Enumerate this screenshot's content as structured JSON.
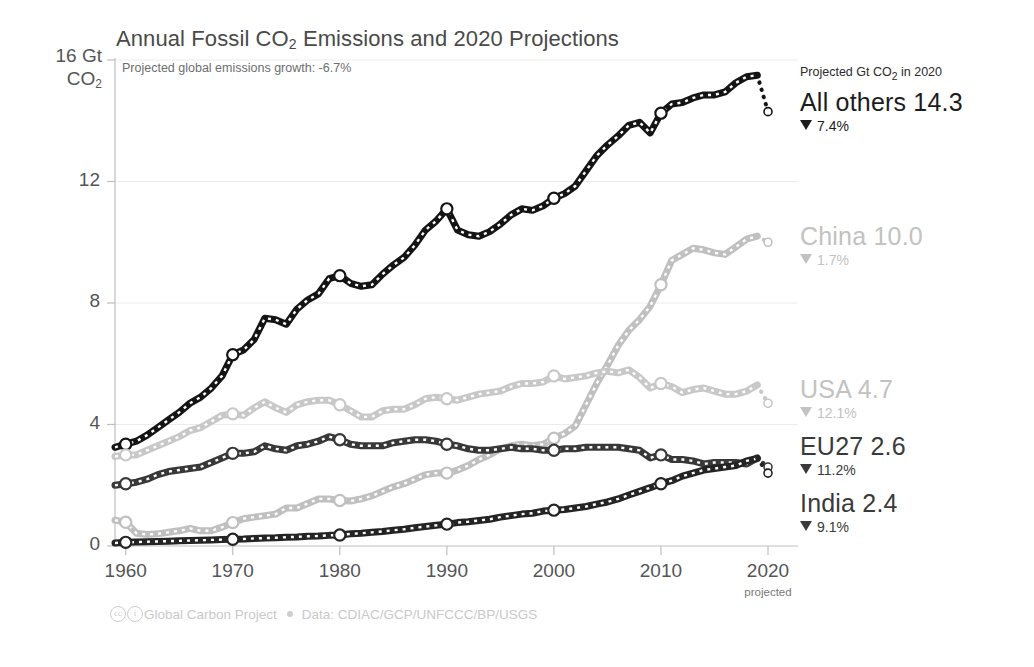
{
  "header": {
    "title_pre": "Annual Fossil CO",
    "title_sub": "2",
    "title_post": " Emissions and 2020 Projections",
    "subtitle": "Projected global emissions growth: -6.7%"
  },
  "axes": {
    "y_top_label_line1": "16 Gt",
    "y_top_label_line2_pre": "CO",
    "y_top_label_line2_sub": "2",
    "y_ticks": [
      "12",
      "8",
      "4",
      "0"
    ],
    "y_tick_values": [
      12,
      8,
      4,
      0
    ],
    "x_ticks": [
      "1960",
      "1970",
      "1980",
      "1990",
      "2000",
      "2010",
      "2020"
    ],
    "x_tick_values": [
      1960,
      1970,
      1980,
      1990,
      2000,
      2010,
      2020
    ],
    "x_sub_note": "projected"
  },
  "legend": {
    "heading_pre": "Projected Gt CO",
    "heading_sub": "2",
    "heading_post": " in 2020",
    "entries": [
      {
        "name": "All others",
        "value": "14.3",
        "label": "All others 14.3",
        "change": "7.4%",
        "color": "#1c1c1c",
        "tone": "dark"
      },
      {
        "name": "China",
        "value": "10.0",
        "label": "China 10.0",
        "change": "1.7%",
        "color": "#c2c2c2",
        "tone": "light"
      },
      {
        "name": "USA",
        "value": "4.7",
        "label": "USA 4.7",
        "change": "12.1%",
        "color": "#bdbdbd",
        "tone": "light"
      },
      {
        "name": "EU27",
        "value": "2.6",
        "label": "EU27 2.6",
        "change": "11.2%",
        "color": "#3a3a3a",
        "tone": "mid"
      },
      {
        "name": "India",
        "value": "2.4",
        "label": "India 2.4",
        "change": "9.1%",
        "color": "#2b2b2b",
        "tone": "mid"
      }
    ]
  },
  "footer": {
    "cc_icon_1": "cc",
    "cc_icon_2": "i",
    "org": "Global Carbon Project",
    "data_credit": "Data: CDIAC/GCP/UNFCCC/BP/USGS"
  },
  "chart_data": {
    "type": "line",
    "title": "Annual Fossil CO2 Emissions and 2020 Projections",
    "subtitle": "Projected global emissions growth: -6.7%",
    "xlabel": "",
    "ylabel": "Gt CO2",
    "xlim": [
      1959,
      2020
    ],
    "ylim": [
      0,
      16
    ],
    "grid": true,
    "legend_position": "right",
    "marker_years": [
      1960,
      1970,
      1980,
      1990,
      2000,
      2010
    ],
    "series": [
      {
        "name": "All others",
        "color": "#141414",
        "projected_2020": 14.3,
        "change_pct": -7.4,
        "x": [
          1959,
          1960,
          1961,
          1962,
          1963,
          1964,
          1965,
          1966,
          1967,
          1968,
          1969,
          1970,
          1971,
          1972,
          1973,
          1974,
          1975,
          1976,
          1977,
          1978,
          1979,
          1980,
          1981,
          1982,
          1983,
          1984,
          1985,
          1986,
          1987,
          1988,
          1989,
          1990,
          1991,
          1992,
          1993,
          1994,
          1995,
          1996,
          1997,
          1998,
          1999,
          2000,
          2001,
          2002,
          2003,
          2004,
          2005,
          2006,
          2007,
          2008,
          2009,
          2010,
          2011,
          2012,
          2013,
          2014,
          2015,
          2016,
          2017,
          2018,
          2019
        ],
        "y": [
          3.25,
          3.35,
          3.45,
          3.65,
          3.9,
          4.15,
          4.4,
          4.7,
          4.9,
          5.2,
          5.6,
          6.3,
          6.45,
          6.8,
          7.5,
          7.45,
          7.3,
          7.8,
          8.1,
          8.3,
          8.8,
          8.9,
          8.65,
          8.55,
          8.6,
          8.95,
          9.25,
          9.5,
          9.9,
          10.4,
          10.7,
          11.1,
          10.4,
          10.25,
          10.2,
          10.35,
          10.6,
          10.9,
          11.1,
          11.05,
          11.2,
          11.45,
          11.6,
          11.85,
          12.35,
          12.85,
          13.2,
          13.5,
          13.85,
          13.95,
          13.6,
          14.25,
          14.55,
          14.6,
          14.75,
          14.85,
          14.85,
          14.95,
          15.25,
          15.45,
          15.5
        ]
      },
      {
        "name": "China",
        "color": "#c0c0c0",
        "projected_2020": 10.0,
        "change_pct": -1.7,
        "x": [
          1959,
          1960,
          1961,
          1962,
          1963,
          1964,
          1965,
          1966,
          1967,
          1968,
          1969,
          1970,
          1971,
          1972,
          1973,
          1974,
          1975,
          1976,
          1977,
          1978,
          1979,
          1980,
          1981,
          1982,
          1983,
          1984,
          1985,
          1986,
          1987,
          1988,
          1989,
          1990,
          1991,
          1992,
          1993,
          1994,
          1995,
          1996,
          1997,
          1998,
          1999,
          2000,
          2001,
          2002,
          2003,
          2004,
          2005,
          2006,
          2007,
          2008,
          2009,
          2010,
          2011,
          2012,
          2013,
          2014,
          2015,
          2016,
          2017,
          2018,
          2019
        ],
        "y": [
          0.85,
          0.78,
          0.42,
          0.38,
          0.4,
          0.45,
          0.5,
          0.58,
          0.5,
          0.5,
          0.62,
          0.77,
          0.9,
          0.95,
          1.0,
          1.05,
          1.25,
          1.25,
          1.4,
          1.55,
          1.55,
          1.5,
          1.48,
          1.55,
          1.65,
          1.8,
          1.95,
          2.05,
          2.2,
          2.35,
          2.4,
          2.4,
          2.5,
          2.65,
          2.85,
          3.0,
          3.2,
          3.3,
          3.35,
          3.3,
          3.35,
          3.55,
          3.7,
          3.95,
          4.65,
          5.35,
          5.95,
          6.6,
          7.1,
          7.45,
          7.9,
          8.6,
          9.4,
          9.6,
          9.8,
          9.75,
          9.65,
          9.6,
          9.85,
          10.1,
          10.2
        ]
      },
      {
        "name": "USA",
        "color": "#c8c8c8",
        "projected_2020": 4.7,
        "change_pct": -12.1,
        "x": [
          1959,
          1960,
          1961,
          1962,
          1963,
          1964,
          1965,
          1966,
          1967,
          1968,
          1969,
          1970,
          1971,
          1972,
          1973,
          1974,
          1975,
          1976,
          1977,
          1978,
          1979,
          1980,
          1981,
          1982,
          1983,
          1984,
          1985,
          1986,
          1987,
          1988,
          1989,
          1990,
          1991,
          1992,
          1993,
          1994,
          1995,
          1996,
          1997,
          1998,
          1999,
          2000,
          2001,
          2002,
          2003,
          2004,
          2005,
          2006,
          2007,
          2008,
          2009,
          2010,
          2011,
          2012,
          2013,
          2014,
          2015,
          2016,
          2017,
          2018,
          2019
        ],
        "y": [
          2.95,
          3.0,
          3.0,
          3.15,
          3.3,
          3.45,
          3.6,
          3.8,
          3.9,
          4.1,
          4.3,
          4.35,
          4.3,
          4.55,
          4.75,
          4.55,
          4.4,
          4.65,
          4.75,
          4.8,
          4.8,
          4.65,
          4.45,
          4.25,
          4.25,
          4.45,
          4.5,
          4.5,
          4.65,
          4.85,
          4.9,
          4.85,
          4.8,
          4.9,
          5.0,
          5.05,
          5.1,
          5.25,
          5.35,
          5.35,
          5.4,
          5.6,
          5.5,
          5.55,
          5.6,
          5.7,
          5.75,
          5.7,
          5.8,
          5.55,
          5.2,
          5.35,
          5.25,
          5.05,
          5.15,
          5.2,
          5.1,
          5.0,
          5.0,
          5.1,
          5.3
        ]
      },
      {
        "name": "EU27",
        "color": "#383838",
        "projected_2020": 2.6,
        "change_pct": -11.2,
        "x": [
          1959,
          1960,
          1961,
          1962,
          1963,
          1964,
          1965,
          1966,
          1967,
          1968,
          1969,
          1970,
          1971,
          1972,
          1973,
          1974,
          1975,
          1976,
          1977,
          1978,
          1979,
          1980,
          1981,
          1982,
          1983,
          1984,
          1985,
          1986,
          1987,
          1988,
          1989,
          1990,
          1991,
          1992,
          1993,
          1994,
          1995,
          1996,
          1997,
          1998,
          1999,
          2000,
          2001,
          2002,
          2003,
          2004,
          2005,
          2006,
          2007,
          2008,
          2009,
          2010,
          2011,
          2012,
          2013,
          2014,
          2015,
          2016,
          2017,
          2018,
          2019
        ],
        "y": [
          2.0,
          2.05,
          2.1,
          2.2,
          2.35,
          2.45,
          2.5,
          2.55,
          2.6,
          2.75,
          2.9,
          3.05,
          3.05,
          3.1,
          3.3,
          3.2,
          3.15,
          3.3,
          3.35,
          3.45,
          3.6,
          3.5,
          3.35,
          3.3,
          3.3,
          3.3,
          3.4,
          3.45,
          3.5,
          3.5,
          3.45,
          3.35,
          3.3,
          3.2,
          3.15,
          3.15,
          3.2,
          3.25,
          3.2,
          3.2,
          3.15,
          3.15,
          3.2,
          3.2,
          3.25,
          3.25,
          3.25,
          3.25,
          3.2,
          3.15,
          2.9,
          3.0,
          2.85,
          2.85,
          2.8,
          2.7,
          2.75,
          2.75,
          2.75,
          2.7,
          2.9
        ]
      },
      {
        "name": "India",
        "color": "#242424",
        "projected_2020": 2.4,
        "change_pct": -9.1,
        "x": [
          1959,
          1960,
          1961,
          1962,
          1963,
          1964,
          1965,
          1966,
          1967,
          1968,
          1969,
          1970,
          1971,
          1972,
          1973,
          1974,
          1975,
          1976,
          1977,
          1978,
          1979,
          1980,
          1981,
          1982,
          1983,
          1984,
          1985,
          1986,
          1987,
          1988,
          1989,
          1990,
          1991,
          1992,
          1993,
          1994,
          1995,
          1996,
          1997,
          1998,
          1999,
          2000,
          2001,
          2002,
          2003,
          2004,
          2005,
          2006,
          2007,
          2008,
          2009,
          2010,
          2011,
          2012,
          2013,
          2014,
          2015,
          2016,
          2017,
          2018,
          2019
        ],
        "y": [
          0.1,
          0.12,
          0.13,
          0.14,
          0.15,
          0.16,
          0.17,
          0.18,
          0.19,
          0.2,
          0.21,
          0.22,
          0.23,
          0.25,
          0.26,
          0.27,
          0.29,
          0.3,
          0.32,
          0.33,
          0.35,
          0.36,
          0.4,
          0.42,
          0.45,
          0.48,
          0.52,
          0.55,
          0.6,
          0.64,
          0.68,
          0.72,
          0.77,
          0.8,
          0.84,
          0.88,
          0.95,
          1.0,
          1.05,
          1.08,
          1.15,
          1.18,
          1.2,
          1.25,
          1.3,
          1.38,
          1.45,
          1.55,
          1.68,
          1.8,
          1.92,
          2.05,
          2.15,
          2.3,
          2.4,
          2.5,
          2.55,
          2.6,
          2.65,
          2.8,
          2.88
        ]
      }
    ]
  }
}
